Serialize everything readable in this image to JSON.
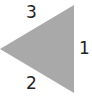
{
  "diagram": {
    "shape": "triangle",
    "orientation": "pointing-left",
    "fill_color": "#a9a9a9",
    "label_color": "#222222",
    "vertices": [
      [
        74,
        5
      ],
      [
        74,
        93
      ],
      [
        0,
        49
      ]
    ],
    "labels": {
      "side_right": "1",
      "side_bottom": "2",
      "side_top": "3"
    }
  }
}
